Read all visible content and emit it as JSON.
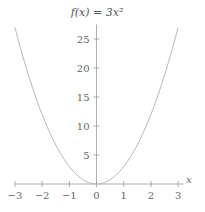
{
  "chart_data": {
    "type": "line",
    "title": "f(x) = 3x²",
    "function": "3x^2",
    "xlabel": "x",
    "ylabel": "",
    "xlim": [
      -3,
      3
    ],
    "ylim": [
      0,
      27
    ],
    "xticks": [
      -3,
      -2,
      -1,
      0,
      1,
      2,
      3
    ],
    "xtick_labels": [
      "−3",
      "−2",
      "−1",
      "0",
      "1",
      "2",
      "3"
    ],
    "yticks": [
      5,
      10,
      15,
      20,
      25
    ],
    "ytick_labels": [
      "5",
      "10",
      "15",
      "20",
      "25"
    ],
    "grid": false,
    "series": [
      {
        "name": "f(x) = 3x²",
        "color": "#b0b0b0",
        "x": [
          -3,
          -2.5,
          -2,
          -1.5,
          -1,
          -0.5,
          0,
          0.5,
          1,
          1.5,
          2,
          2.5,
          3
        ],
        "y": [
          27,
          18.75,
          12,
          6.75,
          3,
          0.75,
          0,
          0.75,
          3,
          6.75,
          12,
          18.75,
          27
        ]
      }
    ]
  },
  "colors": {
    "axis": "#999999",
    "curve": "#b8b8b8",
    "text": "#666666"
  }
}
